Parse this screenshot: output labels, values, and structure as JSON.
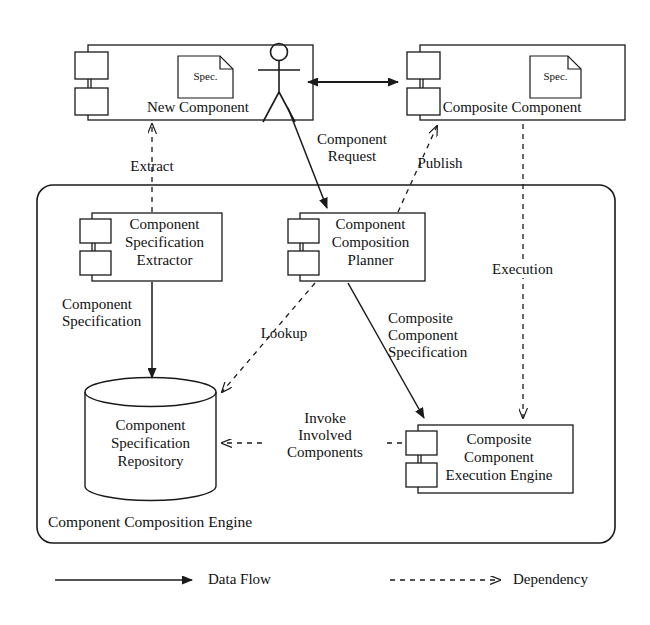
{
  "diagram": {
    "stroke_color": "#1a1a1a",
    "background_color": "#ffffff"
  },
  "actor": {
    "name": "user-actor",
    "x": 278,
    "y": 45
  },
  "components": {
    "new_component": {
      "label": "New Component",
      "spec_label": "Spec.",
      "x": 88,
      "y": 45,
      "w": 225,
      "h": 75
    },
    "composite_component": {
      "label": "Composite Component",
      "spec_label": "Spec.",
      "x": 420,
      "y": 45,
      "w": 205,
      "h": 75
    },
    "spec_extractor": {
      "label": "Component\nSpecification\nExtractor",
      "x": 92,
      "y": 213,
      "w": 130,
      "h": 68
    },
    "composition_planner": {
      "label": "Component\nComposition\nPlanner",
      "x": 300,
      "y": 213,
      "w": 125,
      "h": 68
    },
    "execution_engine": {
      "label": "Composite\nComponent\nExecution Engine",
      "x": 418,
      "y": 425,
      "w": 155,
      "h": 68
    }
  },
  "repository": {
    "label": "Component\nSpecification\nRepository",
    "x": 85,
    "y": 378,
    "w": 131,
    "h": 122
  },
  "container": {
    "label": "Component Composition Engine",
    "x": 37,
    "y": 185,
    "w": 578,
    "h": 358
  },
  "edge_labels": {
    "extract": "Extract",
    "component_request": "Component\nRequest",
    "publish": "Publish",
    "execution": "Execution",
    "component_specification": "Component\nSpecification",
    "lookup": "Lookup",
    "composite_component_specification": "Composite\nComponent\nSpecification",
    "invoke_involved_components": "Invoke\nInvolved\nComponents"
  },
  "legend": {
    "data_flow": "Data Flow",
    "dependency": "Dependency"
  }
}
